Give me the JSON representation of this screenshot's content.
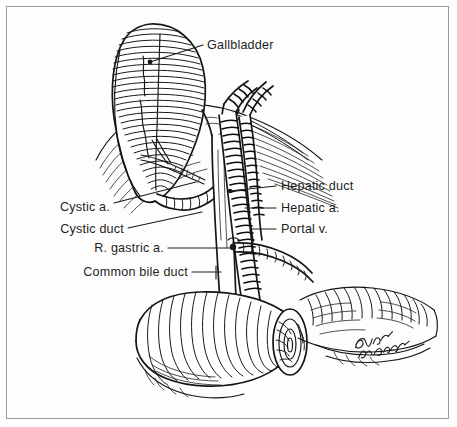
{
  "figure": {
    "domain": "anatomical line illustration",
    "border_color": "#9a9a9a",
    "ink_color": "#151515",
    "background_color": "#fdfdfd"
  },
  "labels": {
    "gallbladder": "Gallbladder",
    "hepatic_duct": "Hepatic duct",
    "hepatic_a": "Hepatic a.",
    "portal_v": "Portal v.",
    "cystic_a": "Cystic a.",
    "cystic_duct": "Cystic duct",
    "r_gastric_a": "R. gastric a.",
    "common_bile_duct": "Common bile duct"
  },
  "structures": [
    {
      "name": "gallbladder",
      "label": "Gallbladder",
      "side": "top-left"
    },
    {
      "name": "hepatic-duct",
      "label": "Hepatic duct",
      "side": "right"
    },
    {
      "name": "hepatic-artery",
      "label": "Hepatic a.",
      "side": "right"
    },
    {
      "name": "portal-vein",
      "label": "Portal v.",
      "side": "right"
    },
    {
      "name": "cystic-artery",
      "label": "Cystic a.",
      "side": "left"
    },
    {
      "name": "cystic-duct",
      "label": "Cystic duct",
      "side": "left"
    },
    {
      "name": "right-gastric-artery",
      "label": "R. gastric a.",
      "side": "left"
    },
    {
      "name": "common-bile-duct",
      "label": "Common bile duct",
      "side": "left"
    },
    {
      "name": "duodenum",
      "label": "",
      "side": "bottom"
    },
    {
      "name": "liver",
      "label": "",
      "side": "top"
    },
    {
      "name": "pancreas",
      "label": "",
      "side": "bottom-right"
    }
  ],
  "signature": {
    "artist_mark": "handwritten signature",
    "position": "bottom-right"
  }
}
